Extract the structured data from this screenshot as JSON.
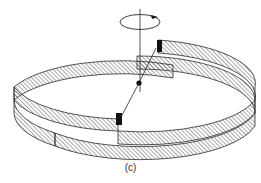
{
  "figure": {
    "caption": "(c)",
    "colors": {
      "background": "#ffffff",
      "stroke": "#2a2a2a",
      "hatch": "#555555",
      "block": "#111111"
    },
    "elements": {
      "rotation_axis": "vertical axis line",
      "rotation_arrow": "circular arrow around axis",
      "pivot": "black pivot dot",
      "rod": "inclined connecting rod",
      "upper_block": "black block at upper step",
      "lower_block": "black block at lower step",
      "upper_band": "upper hatched helical band",
      "lower_band": "lower hatched helical band"
    }
  }
}
